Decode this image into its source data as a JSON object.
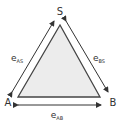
{
  "diagram": {
    "type": "triangle",
    "vertices": {
      "S": {
        "label": "S"
      },
      "A": {
        "label": "A"
      },
      "B": {
        "label": "B"
      }
    },
    "edges": {
      "AS": {
        "label": "e",
        "subscript": "AS"
      },
      "BS": {
        "label": "e",
        "subscript": "BS"
      },
      "AB": {
        "label": "e",
        "subscript": "AB"
      }
    },
    "colors": {
      "fill": "#ececec",
      "stroke": "#444444",
      "arrow": "#333333",
      "text": "#333333"
    }
  }
}
